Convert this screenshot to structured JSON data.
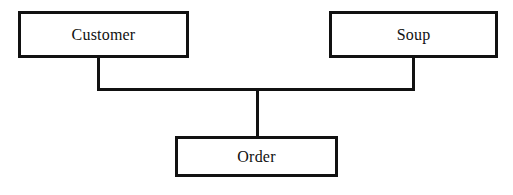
{
  "diagram": {
    "background_color": "#ffffff",
    "stroke_color": "#111111",
    "text_color": "#111111",
    "nodes": [
      {
        "id": "customer",
        "label": "Customer",
        "x": 18,
        "y": 11,
        "width": 171,
        "height": 47
      },
      {
        "id": "soup",
        "label": "Soup",
        "x": 329,
        "y": 11,
        "width": 169,
        "height": 47
      },
      {
        "id": "order",
        "label": "Order",
        "x": 175,
        "y": 136,
        "width": 163,
        "height": 41
      }
    ],
    "edges": [
      {
        "id": "customer-stem",
        "from": "customer",
        "to": "crossbar",
        "orientation": "vertical"
      },
      {
        "id": "soup-stem",
        "from": "soup",
        "to": "crossbar",
        "orientation": "vertical"
      },
      {
        "id": "crossbar",
        "from": "customer-stem",
        "to": "soup-stem",
        "orientation": "horizontal"
      },
      {
        "id": "order-stem",
        "from": "crossbar",
        "to": "order",
        "orientation": "vertical"
      }
    ]
  }
}
